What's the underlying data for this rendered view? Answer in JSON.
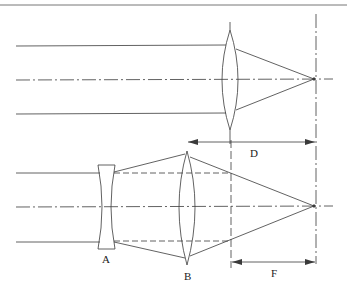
{
  "diagram": {
    "type": "optics-ray-diagram",
    "top_system": {
      "lens": "biconvex",
      "incoming_rays": 3,
      "focal_point": "on optical axis"
    },
    "bottom_system": {
      "lenses": [
        {
          "id": "A",
          "label": "A",
          "type": "biconcave (diverging)"
        },
        {
          "id": "B",
          "label": "B",
          "type": "biconvex (converging)"
        }
      ],
      "incoming_rays": 3
    },
    "dimensions": [
      {
        "id": "D",
        "label": "D",
        "meaning": "distance from single lens to focal plane"
      },
      {
        "id": "F",
        "label": "F",
        "meaning": "effective focal length of lens system"
      }
    ]
  },
  "colors": {
    "line": "#3a3a3a",
    "background": "#ffffff"
  }
}
